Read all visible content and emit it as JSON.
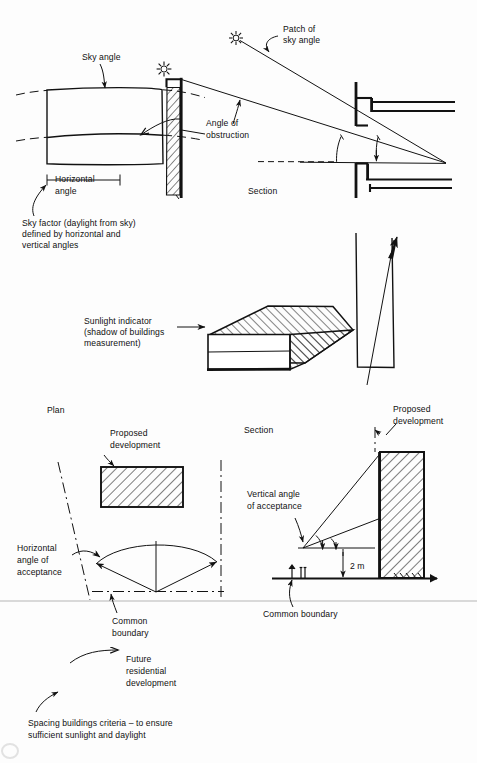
{
  "figure": {
    "kind": "hand-drawn architectural daylight and sunlight diagram",
    "caption": "Spacing buildings criteria – to ensure sufficient sunlight and daylight",
    "caption_line1": "Spacing buildings criteria – to ensure",
    "caption_line2": "sufficient sunlight and daylight"
  },
  "panel_top": {
    "name": "sky factor diagram",
    "labels": {
      "sky_angle": "Sky angle",
      "patch_of_sky_angle_l1": "Patch of",
      "patch_of_sky_angle_l2": "sky angle",
      "angle_of_obstruction_l1": "Angle of",
      "angle_of_obstruction_l2": "obstruction",
      "horizontal_angle_l1": "Horizontal",
      "horizontal_angle_l2": "angle",
      "section": "Section"
    },
    "note_l1": "Sky factor (daylight from sky)",
    "note_l2": "defined by horizontal and",
    "note_l3": "vertical angles",
    "icons": [
      "sun-icon",
      "sun-icon"
    ]
  },
  "panel_middle": {
    "name": "sunlight indicator diagram",
    "labels": {
      "sunlight_indicator_l1": "Sunlight indicator",
      "sunlight_indicator_l2": "(shadow of buildings",
      "sunlight_indicator_l3": "measurement)"
    }
  },
  "panel_bottom": {
    "name": "plan and section spacing diagram",
    "plan": {
      "title": "Plan",
      "proposed_development_l1": "Proposed",
      "proposed_development_l2": "development",
      "horizontal_angle_l1": "Horizontal",
      "horizontal_angle_l2": "angle of",
      "horizontal_angle_l3": "acceptance",
      "common_boundary_l1": "Common",
      "common_boundary_l2": "boundary",
      "future_dev_l1": "Future",
      "future_dev_l2": "residential",
      "future_dev_l3": "development"
    },
    "section": {
      "title": "Section",
      "proposed_development_l1": "Proposed",
      "proposed_development_l2": "development",
      "vertical_angle_l1": "Vertical angle",
      "vertical_angle_l2": "of acceptance",
      "dimension": "2 m",
      "common_boundary": "Common boundary"
    }
  },
  "colors": {
    "ink": "#121212",
    "paper": "#fdfdfd",
    "faint_rule": "#d9d9d9"
  }
}
